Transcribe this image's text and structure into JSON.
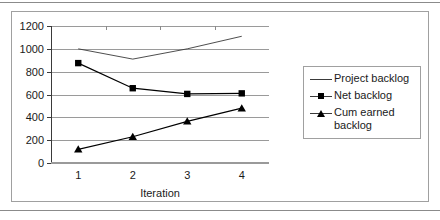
{
  "chart_data": {
    "type": "line",
    "title": "",
    "xlabel": "Iteration",
    "ylabel": "",
    "x": [
      1,
      2,
      3,
      4
    ],
    "xtick_labels": [
      "1",
      "2",
      "3",
      "4"
    ],
    "ytick_labels": [
      "0",
      "200",
      "400",
      "600",
      "800",
      "1000",
      "1200"
    ],
    "yticks": [
      0,
      200,
      400,
      600,
      800,
      1000,
      1200
    ],
    "ylim": [
      0,
      1200
    ],
    "xlim": [
      0.5,
      4.5
    ],
    "grid": "horizontal",
    "legend_position": "right",
    "series": [
      {
        "name": "Project backlog",
        "marker": "none",
        "color": "#3a3a3a",
        "values": [
          1000,
          910,
          1000,
          1110
        ]
      },
      {
        "name": "Net backlog",
        "marker": "square",
        "color": "#000000",
        "values": [
          875,
          655,
          605,
          610
        ]
      },
      {
        "name": "Cum earned backlog",
        "marker": "triangle",
        "color": "#000000",
        "values": [
          120,
          230,
          365,
          480
        ]
      }
    ]
  },
  "legend": {
    "items": [
      {
        "label": "Project backlog",
        "marker": "line"
      },
      {
        "label": "Net backlog",
        "marker": "square"
      },
      {
        "label": "Cum earned backlog",
        "marker": "triangle"
      }
    ]
  }
}
